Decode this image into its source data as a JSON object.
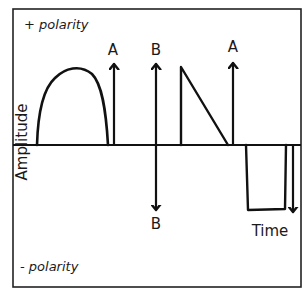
{
  "diagram": {
    "type": "waveform-polarity-diagram",
    "labels": {
      "positive_polarity": "+ polarity",
      "negative_polarity": "- polarity",
      "y_axis": "Amplitude",
      "x_axis": "Time"
    },
    "arrow_labels": {
      "a_first": "A",
      "b_top": "B",
      "b_bottom": "B",
      "a_second": "A"
    },
    "waveforms": [
      {
        "name": "positive-monophasic-arch",
        "polarity": "positive"
      },
      {
        "name": "arrow-a-first",
        "polarity": "positive",
        "label": "A"
      },
      {
        "name": "arrow-b-biphasic",
        "polarity": "both",
        "label": "B"
      },
      {
        "name": "positive-sawtooth",
        "polarity": "positive"
      },
      {
        "name": "arrow-a-second",
        "polarity": "positive",
        "label": "A"
      },
      {
        "name": "negative-square-pulse",
        "polarity": "negative"
      },
      {
        "name": "negative-arrow",
        "polarity": "negative"
      }
    ],
    "colors": {
      "line": "#111111",
      "background": "#ffffff",
      "text": "#1a1a1a"
    }
  }
}
